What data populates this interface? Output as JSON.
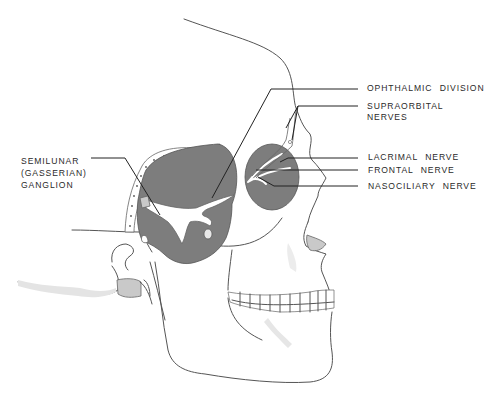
{
  "figure": {
    "colors": {
      "background": "#ffffff",
      "shaded_region": "#7d7d7d",
      "light_region": "#c9c9c9",
      "outline": "#555555",
      "label_text": "#2a2a2a"
    }
  },
  "labels": {
    "ophthalmic_division": "OPHTHALMIC  DIVISION",
    "supraorbital_line1": "SUPRAORBITAL",
    "supraorbital_line2": "NERVES",
    "lacrimal_nerve": "LACRIMAL  NERVE",
    "frontal_nerve": "FRONTAL  NERVE",
    "nasociliary_nerve": "NASOCILIARY  NERVE",
    "semilunar_line1": "SEMILUNAR",
    "semilunar_line2": "(GASSERIAN)",
    "semilunar_line3": "GANGLION"
  }
}
